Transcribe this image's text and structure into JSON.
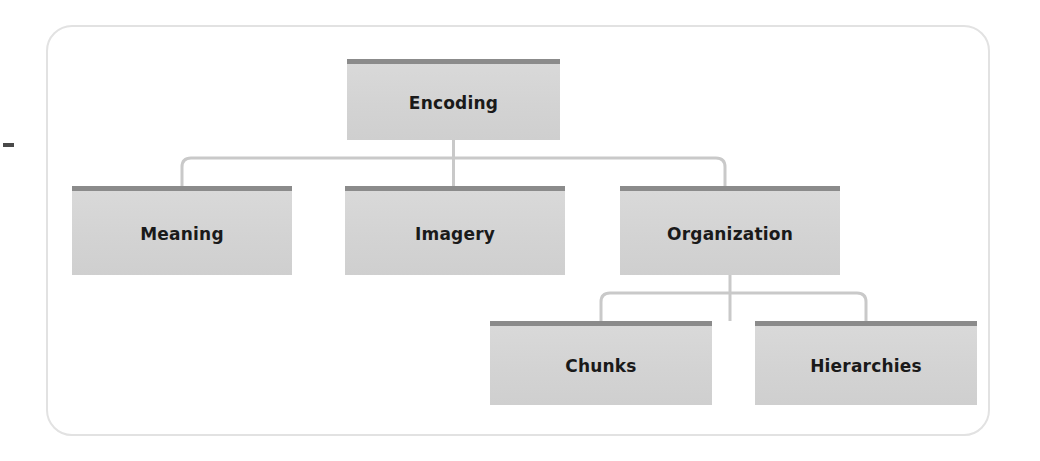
{
  "diagram": {
    "title": "Encoding",
    "type": "hierarchy-tree",
    "colors": {
      "box_fill": "#d4d4d4",
      "box_header_bar": "#8b8b8b",
      "connector": "#c9c9c9",
      "frame_border": "#e2e2e2",
      "text": "#1a1a1a",
      "background": "#ffffff"
    },
    "levels": [
      {
        "level": 1,
        "nodes": [
          {
            "id": "encoding",
            "label": "Encoding"
          }
        ]
      },
      {
        "level": 2,
        "nodes": [
          {
            "id": "meaning",
            "label": "Meaning"
          },
          {
            "id": "imagery",
            "label": "Imagery"
          },
          {
            "id": "organization",
            "label": "Organization"
          }
        ]
      },
      {
        "level": 3,
        "nodes": [
          {
            "id": "chunks",
            "label": "Chunks"
          },
          {
            "id": "hierarchies",
            "label": "Hierarchies"
          }
        ]
      }
    ],
    "edges": [
      {
        "from": "encoding",
        "to": "meaning"
      },
      {
        "from": "encoding",
        "to": "imagery"
      },
      {
        "from": "encoding",
        "to": "organization"
      },
      {
        "from": "organization",
        "to": "chunks"
      },
      {
        "from": "organization",
        "to": "hierarchies"
      }
    ]
  }
}
